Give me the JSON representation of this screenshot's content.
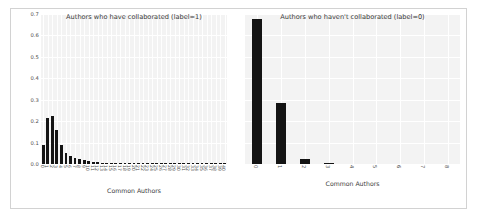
{
  "figure": {
    "background": "#ffffff",
    "panel_background": "#f3f3f3",
    "grid_color": "#ffffff",
    "bar_color": "#141414",
    "frame_color": "#d2d2d2"
  },
  "yaxis": {
    "ticks": [
      "0.0",
      "0.1",
      "0.2",
      "0.3",
      "0.4",
      "0.5",
      "0.6",
      "0.7"
    ],
    "min": 0.0,
    "max": 0.7
  },
  "panels": [
    {
      "key": "left",
      "title": "Authors who have collaborated (label=1)",
      "xlabel": "Common Authors"
    },
    {
      "key": "right",
      "title": "Authors who haven't collaborated (label=0)",
      "xlabel": "Common Authors"
    }
  ],
  "chart_data": [
    {
      "type": "bar",
      "title": "Authors who have collaborated (label=1)",
      "xlabel": "Common Authors",
      "ylabel": "",
      "ylim": [
        0.0,
        0.7
      ],
      "yticks": [
        0.0,
        0.1,
        0.2,
        0.3,
        0.4,
        0.5,
        0.6,
        0.7
      ],
      "grid": true,
      "legend": "none",
      "categories": [
        "0",
        "1",
        "2",
        "3",
        "4",
        "5",
        "6",
        "7",
        "8",
        "9",
        "10",
        "11",
        "12",
        "13",
        "14",
        "15",
        "16",
        "17",
        "18",
        "19",
        "20",
        "21",
        "22",
        "23",
        "24",
        "25",
        "26",
        "27",
        "28",
        "29",
        "30",
        "31",
        "32",
        "33",
        "34",
        "35",
        "36",
        "37",
        "38",
        "39",
        "40"
      ],
      "values": [
        0.09,
        0.215,
        0.225,
        0.16,
        0.09,
        0.052,
        0.038,
        0.03,
        0.022,
        0.018,
        0.012,
        0.01,
        0.008,
        0.006,
        0.005,
        0.004,
        0.004,
        0.003,
        0.003,
        0.003,
        0.002,
        0.002,
        0.002,
        0.002,
        0.002,
        0.001,
        0.001,
        0.001,
        0.001,
        0.001,
        0.001,
        0.001,
        0.001,
        0.001,
        0.001,
        0.001,
        0.001,
        0.001,
        0.001,
        0.001,
        0.001
      ]
    },
    {
      "type": "bar",
      "title": "Authors who haven't collaborated (label=0)",
      "xlabel": "Common Authors",
      "ylabel": "",
      "ylim": [
        0.0,
        0.7
      ],
      "yticks": [
        0.0,
        0.1,
        0.2,
        0.3,
        0.4,
        0.5,
        0.6,
        0.7
      ],
      "grid": true,
      "legend": "none",
      "categories": [
        "0",
        "1",
        "2",
        "3",
        "4",
        "5",
        "6",
        "7",
        "8"
      ],
      "values": [
        0.675,
        0.285,
        0.025,
        0.004,
        0.0,
        0.0,
        0.0,
        0.0,
        0.0
      ]
    }
  ]
}
